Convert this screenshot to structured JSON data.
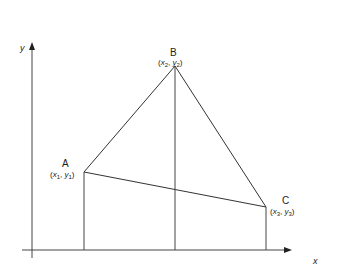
{
  "axes": {
    "x_label": "x",
    "y_label": "y",
    "origin": [
      32,
      250
    ],
    "x_end": 290,
    "y_top": 44
  },
  "points": [
    {
      "id": "A",
      "name": "A",
      "x": 84,
      "y": 172,
      "coord_x": "x",
      "coord_x_sub": "1",
      "coord_y": "y",
      "coord_y_sub": "1"
    },
    {
      "id": "B",
      "name": "B",
      "x": 175,
      "y": 66,
      "coord_x": "x",
      "coord_x_sub": "2",
      "coord_y": "y",
      "coord_y_sub": "2"
    },
    {
      "id": "C",
      "name": "C",
      "x": 266,
      "y": 207,
      "coord_x": "x",
      "coord_x_sub": "3",
      "coord_y": "y",
      "coord_y_sub": "3"
    }
  ],
  "colors": {
    "line": "#333333",
    "axis": "#444444"
  }
}
